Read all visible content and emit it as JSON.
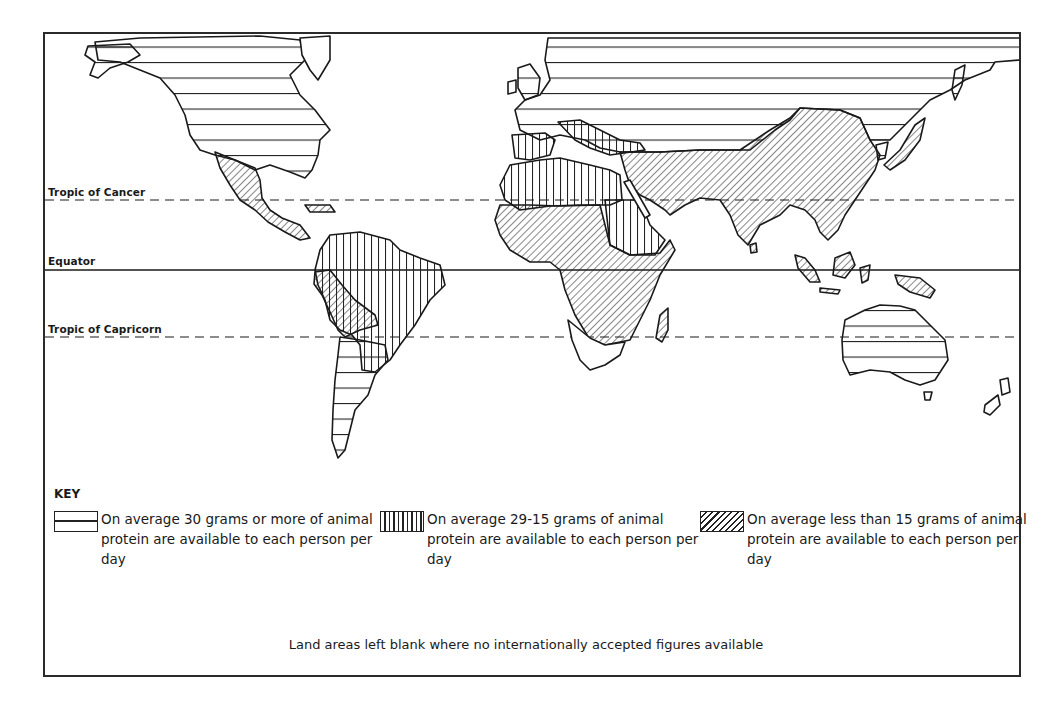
{
  "map": {
    "title": "Animal protein available per person per day",
    "latitude_lines": [
      {
        "label": "Tropic of Cancer",
        "style": "dashed",
        "y": 200
      },
      {
        "label": "Equator",
        "style": "solid",
        "y": 270
      },
      {
        "label": "Tropic of Capricorn",
        "style": "dashed",
        "y": 337
      }
    ],
    "regions": [
      {
        "name": "North America (USA, Canada)",
        "category": "high"
      },
      {
        "name": "Mexico & Central America",
        "category": "low"
      },
      {
        "name": "Northern South America / Brazil",
        "category": "medium"
      },
      {
        "name": "Andean region (Peru, Bolivia)",
        "category": "low"
      },
      {
        "name": "Southern South America (Argentina, Uruguay, Chile)",
        "category": "high"
      },
      {
        "name": "Europe & USSR",
        "category": "high"
      },
      {
        "name": "Southern Europe / North Africa",
        "category": "medium"
      },
      {
        "name": "Sahel / Sudan / East Africa",
        "category": "medium"
      },
      {
        "name": "Sub-Saharan Africa",
        "category": "low"
      },
      {
        "name": "Middle East, South & East Asia",
        "category": "low"
      },
      {
        "name": "Indonesia / New Guinea",
        "category": "low"
      },
      {
        "name": "Australia & New Zealand",
        "category": "high"
      },
      {
        "name": "Japan",
        "category": "low"
      },
      {
        "name": "Southern Africa",
        "category": "blank"
      }
    ]
  },
  "key": {
    "title": "KEY",
    "items": [
      {
        "pattern": "horizontal-lines",
        "label": "On average 30 grams or more of animal protein are available to each person per day"
      },
      {
        "pattern": "vertical-lines",
        "label": "On average 29-15 grams of animal protein are available to each person per day"
      },
      {
        "pattern": "diagonal-hatch",
        "label": "On average less than 15 grams of animal protein are available to each person per day"
      }
    ]
  },
  "footnote": "Land areas left blank where no internationally accepted figures available",
  "colors": {
    "ink": "#1a1a1a",
    "paper": "#ffffff"
  }
}
